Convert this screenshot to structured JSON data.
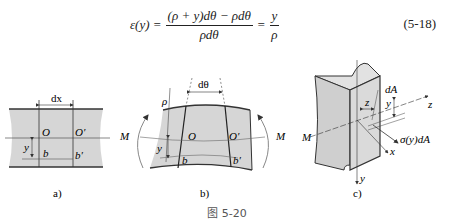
{
  "equation": {
    "lhs": "ε(y) =",
    "numerator": "(ρ + y)dθ − ρdθ",
    "denominator": "ρdθ",
    "eq2": "=",
    "rhs_numerator": "y",
    "rhs_denominator": "ρ",
    "number": "(5-18)"
  },
  "figure": {
    "caption": "图 5-20",
    "panels": [
      {
        "id": "a",
        "label": "a)",
        "annotations": [
          "dx",
          "O",
          "O′",
          "y",
          "b",
          "b′"
        ]
      },
      {
        "id": "b",
        "label": "b)",
        "annotations": [
          "dθ",
          "ρ",
          "M",
          "O",
          "O′",
          "y",
          "b",
          "b′",
          "M"
        ]
      },
      {
        "id": "c",
        "label": "c)",
        "annotations": [
          "dA",
          "z",
          "z",
          "y",
          "M",
          "σ(y)dA",
          "x",
          "y"
        ]
      }
    ]
  }
}
